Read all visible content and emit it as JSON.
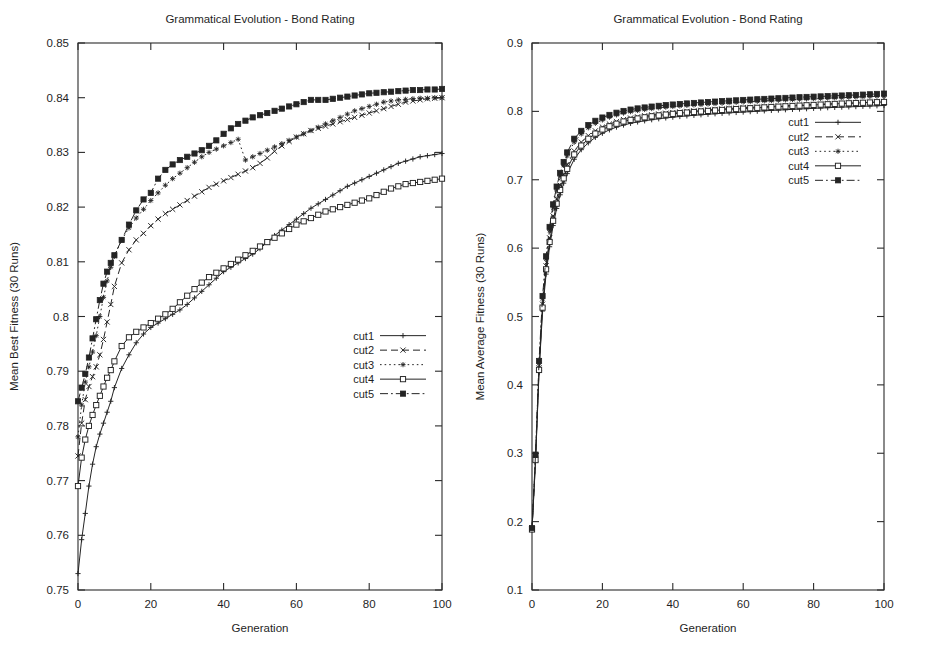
{
  "page": {
    "background": "#ffffff",
    "ink": "#242424",
    "width": 931,
    "height": 670
  },
  "charts": [
    {
      "id": "left",
      "title": "Grammatical Evolution - Bond Rating",
      "xlabel": "Generation",
      "ylabel": "Mean Best Fitness (30 Runs)",
      "legend_position": "bottom-right-inside",
      "chart_data": {
        "type": "line",
        "title": "Grammatical Evolution - Bond Rating",
        "xlabel": "Generation",
        "ylabel": "Mean Best Fitness (30 Runs)",
        "xlim": [
          0,
          100
        ],
        "ylim": [
          0.75,
          0.85
        ],
        "xticks": [
          0,
          20,
          40,
          60,
          80,
          100
        ],
        "yticks": [
          0.75,
          0.76,
          0.77,
          0.78,
          0.79,
          0.8,
          0.81,
          0.82,
          0.83,
          0.84,
          0.85
        ],
        "ytick_labels": [
          "0.75",
          "0.76",
          "0.77",
          "0.78",
          "0.79",
          "0.8",
          "0.81",
          "0.82",
          "0.83",
          "0.84",
          "0.85"
        ],
        "xtick_labels": [
          "0",
          "20",
          "40",
          "60",
          "80",
          "100"
        ],
        "grid": false,
        "x": [
          0,
          1,
          2,
          3,
          4,
          5,
          6,
          7,
          8,
          9,
          10,
          12,
          14,
          16,
          18,
          20,
          22,
          24,
          26,
          28,
          30,
          32,
          34,
          36,
          38,
          40,
          42,
          44,
          46,
          48,
          50,
          52,
          54,
          56,
          58,
          60,
          62,
          64,
          66,
          68,
          70,
          72,
          74,
          76,
          78,
          80,
          82,
          84,
          86,
          88,
          90,
          92,
          94,
          96,
          98,
          100
        ],
        "series": [
          {
            "name": "cut1",
            "marker": "plus",
            "dash": "solid",
            "values": [
              0.753,
              0.7592,
              0.764,
              0.769,
              0.773,
              0.7762,
              0.7785,
              0.7805,
              0.7825,
              0.7845,
              0.787,
              0.7905,
              0.793,
              0.7952,
              0.7968,
              0.798,
              0.7988,
              0.7996,
              0.8004,
              0.8012,
              0.8022,
              0.8034,
              0.8046,
              0.8058,
              0.807,
              0.8082,
              0.809,
              0.8098,
              0.8106,
              0.8114,
              0.8124,
              0.8136,
              0.8148,
              0.8158,
              0.8168,
              0.8178,
              0.8188,
              0.8198,
              0.8206,
              0.8214,
              0.8222,
              0.823,
              0.8238,
              0.8244,
              0.825,
              0.8256,
              0.8262,
              0.8268,
              0.8274,
              0.828,
              0.8284,
              0.8288,
              0.8292,
              0.8294,
              0.8296,
              0.8298
            ]
          },
          {
            "name": "cut2",
            "marker": "cross",
            "dash": "dashed",
            "values": [
              0.7745,
              0.7805,
              0.7848,
              0.7872,
              0.789,
              0.7908,
              0.793,
              0.7958,
              0.799,
              0.8022,
              0.8055,
              0.8098,
              0.8122,
              0.814,
              0.8152,
              0.8166,
              0.8178,
              0.8188,
              0.8196,
              0.8204,
              0.8212,
              0.822,
              0.8228,
              0.8236,
              0.8242,
              0.8248,
              0.8254,
              0.826,
              0.8266,
              0.8272,
              0.828,
              0.829,
              0.8302,
              0.8312,
              0.832,
              0.8328,
              0.8334,
              0.834,
              0.8344,
              0.8348,
              0.8352,
              0.8356,
              0.836,
              0.8364,
              0.8368,
              0.8372,
              0.8376,
              0.838,
              0.8384,
              0.8388,
              0.8392,
              0.8394,
              0.8396,
              0.8398,
              0.8399,
              0.84
            ]
          },
          {
            "name": "cut3",
            "marker": "star",
            "dash": "dotted",
            "values": [
              0.778,
              0.7838,
              0.788,
              0.7908,
              0.7935,
              0.7965,
              0.8,
              0.8035,
              0.8065,
              0.809,
              0.811,
              0.814,
              0.8162,
              0.818,
              0.8196,
              0.8212,
              0.8226,
              0.824,
              0.8252,
              0.8262,
              0.8272,
              0.8282,
              0.8292,
              0.83,
              0.8306,
              0.8312,
              0.8318,
              0.8324,
              0.8286,
              0.8292,
              0.8298,
              0.8304,
              0.831,
              0.8316,
              0.8322,
              0.8328,
              0.8334,
              0.834,
              0.8346,
              0.8352,
              0.8358,
              0.8364,
              0.837,
              0.8376,
              0.838,
              0.8384,
              0.8388,
              0.8392,
              0.8394,
              0.8396,
              0.8397,
              0.8398,
              0.8399,
              0.8399,
              0.84,
              0.84
            ]
          },
          {
            "name": "cut4",
            "marker": "opensquare",
            "dash": "solid",
            "values": [
              0.769,
              0.7742,
              0.7775,
              0.78,
              0.782,
              0.7838,
              0.7855,
              0.7872,
              0.7888,
              0.7902,
              0.7918,
              0.7946,
              0.7962,
              0.7972,
              0.798,
              0.7988,
              0.7996,
              0.8004,
              0.8014,
              0.8026,
              0.8038,
              0.805,
              0.8062,
              0.8072,
              0.808,
              0.8088,
              0.8096,
              0.8104,
              0.8112,
              0.812,
              0.8128,
              0.8136,
              0.8144,
              0.8152,
              0.816,
              0.8168,
              0.8174,
              0.818,
              0.8186,
              0.8192,
              0.8196,
              0.82,
              0.8204,
              0.8208,
              0.8212,
              0.8216,
              0.8222,
              0.8228,
              0.8234,
              0.8238,
              0.8242,
              0.8244,
              0.8246,
              0.8248,
              0.825,
              0.8252
            ]
          },
          {
            "name": "cut5",
            "marker": "filledsquare",
            "dash": "dashdot",
            "values": [
              0.7845,
              0.787,
              0.7895,
              0.7925,
              0.796,
              0.7995,
              0.803,
              0.806,
              0.8082,
              0.8098,
              0.8112,
              0.814,
              0.8168,
              0.8194,
              0.8214,
              0.8226,
              0.8252,
              0.8268,
              0.8278,
              0.8286,
              0.8292,
              0.8298,
              0.8304,
              0.8312,
              0.8322,
              0.8334,
              0.8344,
              0.8352,
              0.8358,
              0.8364,
              0.8368,
              0.8372,
              0.8376,
              0.838,
              0.8384,
              0.8388,
              0.8392,
              0.8396,
              0.8396,
              0.8396,
              0.8398,
              0.84,
              0.8402,
              0.8404,
              0.8406,
              0.8408,
              0.8409,
              0.841,
              0.8411,
              0.8412,
              0.8413,
              0.8414,
              0.8414,
              0.8415,
              0.8415,
              0.8416
            ]
          }
        ]
      }
    },
    {
      "id": "right",
      "title": "Grammatical Evolution - Bond Rating",
      "xlabel": "Generation",
      "ylabel": "Mean Average Fitness (30 Runs)",
      "legend_position": "middle-right-inside",
      "chart_data": {
        "type": "line",
        "title": "Grammatical Evolution - Bond Rating",
        "xlabel": "Generation",
        "ylabel": "Mean Average Fitness (30 Runs)",
        "xlim": [
          0,
          100
        ],
        "ylim": [
          0.1,
          0.9
        ],
        "xticks": [
          0,
          20,
          40,
          60,
          80,
          100
        ],
        "yticks": [
          0.1,
          0.2,
          0.3,
          0.4,
          0.5,
          0.6,
          0.7,
          0.8,
          0.9
        ],
        "ytick_labels": [
          "0.1",
          "0.2",
          "0.3",
          "0.4",
          "0.5",
          "0.6",
          "0.7",
          "0.8",
          "0.9"
        ],
        "xtick_labels": [
          "0",
          "20",
          "40",
          "60",
          "80",
          "100"
        ],
        "grid": false,
        "x": [
          0,
          1,
          2,
          3,
          4,
          5,
          6,
          7,
          8,
          9,
          10,
          12,
          14,
          16,
          18,
          20,
          22,
          24,
          26,
          28,
          30,
          32,
          34,
          36,
          38,
          40,
          42,
          44,
          46,
          48,
          50,
          52,
          54,
          56,
          58,
          60,
          62,
          64,
          66,
          68,
          70,
          72,
          74,
          76,
          78,
          80,
          82,
          84,
          86,
          88,
          90,
          92,
          94,
          96,
          98,
          100
        ],
        "series": [
          {
            "name": "cut1",
            "marker": "plus",
            "dash": "solid",
            "values": [
              0.188,
              0.288,
              0.418,
              0.508,
              0.562,
              0.602,
              0.633,
              0.658,
              0.678,
              0.695,
              0.709,
              0.73,
              0.744,
              0.754,
              0.762,
              0.768,
              0.773,
              0.777,
              0.78,
              0.7825,
              0.7845,
              0.7862,
              0.7878,
              0.7892,
              0.7904,
              0.7915,
              0.7925,
              0.7934,
              0.7942,
              0.795,
              0.7958,
              0.7965,
              0.7972,
              0.7978,
              0.7984,
              0.799,
              0.7996,
              0.8002,
              0.8008,
              0.8014,
              0.8019,
              0.8024,
              0.8029,
              0.8034,
              0.8039,
              0.8044,
              0.8049,
              0.8054,
              0.8058,
              0.8062,
              0.8066,
              0.807,
              0.8074,
              0.8078,
              0.8082,
              0.8086
            ]
          },
          {
            "name": "cut2",
            "marker": "cross",
            "dash": "dashed",
            "values": [
              0.189,
              0.292,
              0.425,
              0.518,
              0.574,
              0.615,
              0.647,
              0.672,
              0.692,
              0.708,
              0.722,
              0.742,
              0.755,
              0.7645,
              0.7715,
              0.777,
              0.7815,
              0.785,
              0.788,
              0.7902,
              0.792,
              0.7936,
              0.795,
              0.7962,
              0.7973,
              0.7983,
              0.7992,
              0.8,
              0.8008,
              0.8015,
              0.8022,
              0.8029,
              0.8035,
              0.8041,
              0.8047,
              0.8053,
              0.8058,
              0.8063,
              0.8068,
              0.8073,
              0.8078,
              0.8083,
              0.8088,
              0.8092,
              0.8096,
              0.81,
              0.8104,
              0.8108,
              0.8112,
              0.8116,
              0.812,
              0.8124,
              0.8128,
              0.8132,
              0.8136,
              0.814
            ]
          },
          {
            "name": "cut3",
            "marker": "star",
            "dash": "dotted",
            "values": [
              0.19,
              0.296,
              0.432,
              0.526,
              0.584,
              0.626,
              0.659,
              0.685,
              0.705,
              0.721,
              0.735,
              0.755,
              0.767,
              0.776,
              0.7825,
              0.7875,
              0.7915,
              0.7948,
              0.7975,
              0.7996,
              0.8013,
              0.8028,
              0.8041,
              0.8052,
              0.8062,
              0.8071,
              0.8079,
              0.8087,
              0.8094,
              0.8101,
              0.8108,
              0.8114,
              0.812,
              0.8126,
              0.8132,
              0.8138,
              0.8143,
              0.8148,
              0.8153,
              0.8158,
              0.8163,
              0.8168,
              0.8173,
              0.8178,
              0.8182,
              0.8186,
              0.819,
              0.8194,
              0.8198,
              0.8202,
              0.8206,
              0.821,
              0.8214,
              0.8218,
              0.8222,
              0.8226
            ]
          },
          {
            "name": "cut4",
            "marker": "opensquare",
            "dash": "solid",
            "values": [
              0.1885,
              0.29,
              0.422,
              0.513,
              0.569,
              0.609,
              0.64,
              0.665,
              0.685,
              0.702,
              0.716,
              0.737,
              0.75,
              0.76,
              0.7675,
              0.7735,
              0.7782,
              0.782,
              0.7852,
              0.7876,
              0.7896,
              0.7913,
              0.7928,
              0.7941,
              0.7953,
              0.7964,
              0.7974,
              0.7983,
              0.7991,
              0.7999,
              0.8007,
              0.8014,
              0.8021,
              0.8028,
              0.8034,
              0.804,
              0.8046,
              0.8052,
              0.8058,
              0.8064,
              0.8069,
              0.8074,
              0.8079,
              0.8084,
              0.8089,
              0.8094,
              0.8099,
              0.8104,
              0.8109,
              0.8114,
              0.8118,
              0.8122,
              0.8126,
              0.813,
              0.8134,
              0.8138
            ]
          },
          {
            "name": "cut5",
            "marker": "filledsquare",
            "dash": "dashdot",
            "values": [
              0.1905,
              0.298,
              0.435,
              0.53,
              0.588,
              0.631,
              0.664,
              0.69,
              0.71,
              0.726,
              0.74,
              0.76,
              0.7715,
              0.78,
              0.7862,
              0.791,
              0.7948,
              0.798,
              0.8006,
              0.8026,
              0.8043,
              0.8057,
              0.807,
              0.8081,
              0.8091,
              0.81,
              0.8108,
              0.8116,
              0.8123,
              0.813,
              0.8137,
              0.8143,
              0.8149,
              0.8155,
              0.8161,
              0.8167,
              0.8172,
              0.8177,
              0.8182,
              0.8187,
              0.8192,
              0.8197,
              0.8202,
              0.8207,
              0.8211,
              0.8215,
              0.8219,
              0.8223,
              0.8228,
              0.8232,
              0.8236,
              0.824,
              0.8245,
              0.825,
              0.8255,
              0.826
            ]
          }
        ]
      }
    }
  ]
}
